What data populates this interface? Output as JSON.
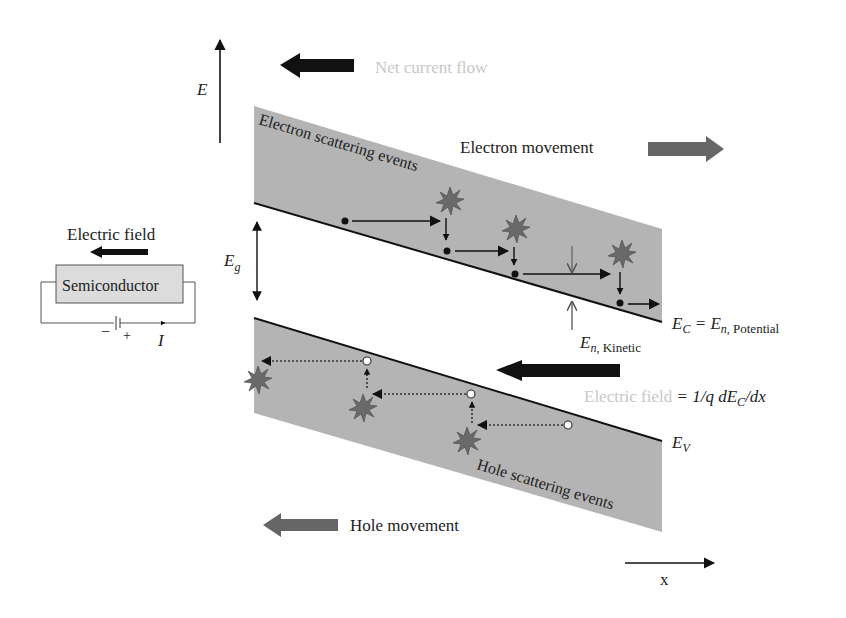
{
  "axes": {
    "energy_label": "E",
    "x_label": "x"
  },
  "annotations": {
    "net_current_flow": "Net current flow",
    "electron_movement": "Electron movement",
    "hole_movement": "Hole movement",
    "electron_scattering": "Electron scattering events",
    "hole_scattering": "Hole scattering events",
    "bandgap": "E",
    "bandgap_sub": "g",
    "ec_main": "E",
    "ec_sub": "C",
    "ec_eq": " = E",
    "ec_sub2": "n,",
    "ec_potential": " Potential",
    "ev_main": "E",
    "ev_sub": "V",
    "kinetic_main": "E",
    "kinetic_sub": "n,",
    "kinetic_word": " Kinetic",
    "efield_word": "Electric field",
    "efield_eq": " = 1/q dE",
    "efield_sub": "C",
    "efield_tail": "/dx"
  },
  "circuit": {
    "title": "Electric field",
    "device": "Semiconductor",
    "minus": "−",
    "plus": "+",
    "current": "I"
  },
  "colors": {
    "band_fill": "#b4b4b4",
    "arrow_dark": "#111111",
    "arrow_grey": "#666666",
    "star_fill": "#6a6a6a",
    "faint_text": "#c8c8c8"
  }
}
